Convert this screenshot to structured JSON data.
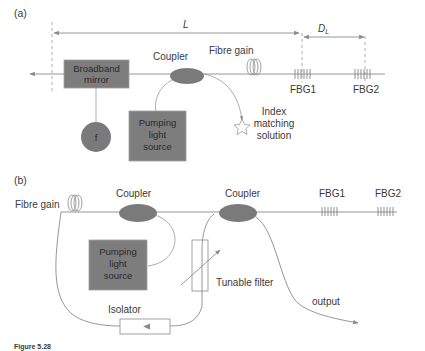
{
  "figure": {
    "panel_a": {
      "label": "(a)",
      "length_label": "L",
      "dl_label_main": "D",
      "dl_label_sub": "L",
      "components": {
        "broadband_mirror_line1": "Broadband",
        "broadband_mirror_line2": "mirror",
        "f_circle": "f",
        "coupler": "Coupler",
        "fibre_gain": "Fibre gain",
        "pump_line1": "Pumping",
        "pump_line2": "light",
        "pump_line3": "source",
        "fbg1": "FBG1",
        "fbg2": "FBG2",
        "index_line1": "Index",
        "index_line2": "matching",
        "index_line3": "solution"
      }
    },
    "panel_b": {
      "label": "(b)",
      "components": {
        "fibre_gain": "Fibre gain",
        "coupler_left": "Coupler",
        "coupler_right": "Coupler",
        "pump_line1": "Pumping",
        "pump_line2": "light",
        "pump_line3": "source",
        "tunable_filter": "Tunable filter",
        "isolator": "Isolator",
        "output": "output",
        "fbg1": "FBG1",
        "fbg2": "FBG2"
      }
    },
    "caption_prefix": "Figure 5.28"
  },
  "colors": {
    "box_fill": "#7d7d7d",
    "line": "#8a8a8a",
    "text": "#3a3a3a"
  }
}
